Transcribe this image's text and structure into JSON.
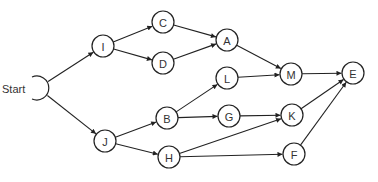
{
  "diagram": {
    "type": "network-precedence-graph",
    "start_label": "Start",
    "nodes": [
      {
        "id": "I",
        "label": "I"
      },
      {
        "id": "C",
        "label": "C"
      },
      {
        "id": "D",
        "label": "D"
      },
      {
        "id": "A",
        "label": "A"
      },
      {
        "id": "J",
        "label": "J"
      },
      {
        "id": "B",
        "label": "B"
      },
      {
        "id": "H",
        "label": "H"
      },
      {
        "id": "L",
        "label": "L"
      },
      {
        "id": "G",
        "label": "G"
      },
      {
        "id": "M",
        "label": "M"
      },
      {
        "id": "K",
        "label": "K"
      },
      {
        "id": "F",
        "label": "F"
      },
      {
        "id": "E",
        "label": "E"
      }
    ],
    "edges": [
      {
        "from": "Start",
        "to": "I"
      },
      {
        "from": "Start",
        "to": "J"
      },
      {
        "from": "I",
        "to": "C"
      },
      {
        "from": "I",
        "to": "D"
      },
      {
        "from": "C",
        "to": "A"
      },
      {
        "from": "D",
        "to": "A"
      },
      {
        "from": "A",
        "to": "M"
      },
      {
        "from": "J",
        "to": "B"
      },
      {
        "from": "J",
        "to": "H"
      },
      {
        "from": "B",
        "to": "L"
      },
      {
        "from": "B",
        "to": "G"
      },
      {
        "from": "L",
        "to": "M"
      },
      {
        "from": "G",
        "to": "K"
      },
      {
        "from": "H",
        "to": "K"
      },
      {
        "from": "H",
        "to": "F"
      },
      {
        "from": "M",
        "to": "E"
      },
      {
        "from": "K",
        "to": "E"
      },
      {
        "from": "F",
        "to": "E"
      }
    ]
  }
}
